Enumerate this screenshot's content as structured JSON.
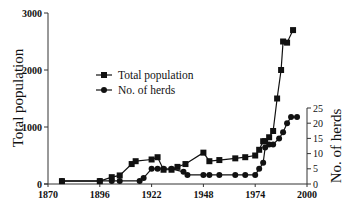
{
  "chart_data": {
    "type": "line",
    "title": "",
    "xlabel": "",
    "ylabel": "Total population",
    "y2label": "No. of herds",
    "xlim": [
      1870,
      2000
    ],
    "ylim": [
      0,
      3000
    ],
    "y2lim": [
      0,
      25
    ],
    "x_ticks": [
      1870,
      1896,
      1922,
      1948,
      1974,
      2000
    ],
    "y_ticks": [
      0,
      1000,
      2000,
      3000
    ],
    "y2_ticks": [
      0,
      5,
      10,
      15,
      20,
      25
    ],
    "grid": false,
    "legend_position": "upper-left-center",
    "series": [
      {
        "name": "Total population",
        "marker": "square",
        "axis": "left",
        "x": [
          1877,
          1896,
          1902,
          1906,
          1912,
          1914,
          1922,
          1925,
          1928,
          1932,
          1935,
          1939,
          1948,
          1951,
          1956,
          1964,
          1969,
          1974,
          1976,
          1978,
          1979,
          1981,
          1983,
          1985,
          1987,
          1988,
          1990,
          1993
        ],
        "values": [
          50,
          50,
          120,
          150,
          350,
          400,
          430,
          470,
          250,
          250,
          300,
          350,
          550,
          400,
          420,
          450,
          470,
          500,
          600,
          750,
          750,
          820,
          930,
          1500,
          2000,
          2500,
          2480,
          2700
        ]
      },
      {
        "name": "No. of herds",
        "marker": "circle",
        "axis": "right",
        "x": [
          1877,
          1896,
          1902,
          1906,
          1916,
          1918,
          1922,
          1925,
          1928,
          1932,
          1938,
          1940,
          1948,
          1951,
          1956,
          1964,
          1969,
          1974,
          1976,
          1978,
          1979,
          1981,
          1983,
          1986,
          1988,
          1990,
          1992,
          1995
        ],
        "values": [
          1,
          1,
          1,
          1,
          1,
          2,
          5,
          5,
          5,
          5,
          4,
          3,
          3,
          3,
          3,
          3,
          3,
          3,
          5,
          7,
          12,
          13,
          13,
          15,
          17,
          20,
          22,
          22
        ]
      }
    ]
  },
  "labels": {
    "ylabel": "Total population",
    "y2label": "No. of herds",
    "legend": [
      "Total population",
      "No. of herds"
    ]
  }
}
